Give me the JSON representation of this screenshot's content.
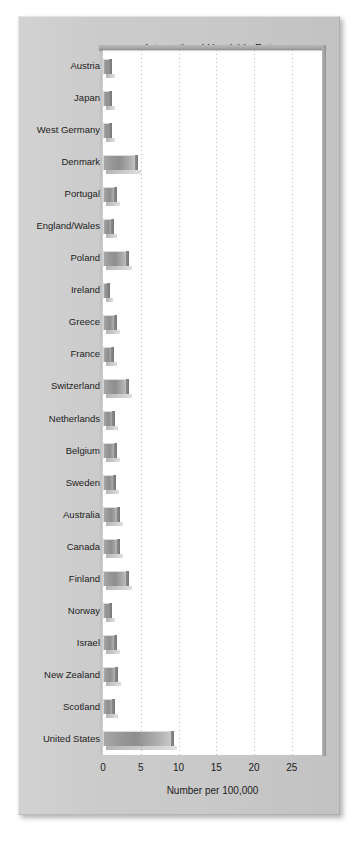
{
  "figure": {
    "title": "International Homicide Rates",
    "card_color": "#c9c9c9",
    "plot_background": "#ffffff",
    "bar_color": "#9a9a9a"
  },
  "chart_data": {
    "type": "bar",
    "orientation": "horizontal",
    "title": "International Homicide Rates",
    "xlabel": "Number per 100,000",
    "ylabel": "",
    "xlim": [
      0,
      29
    ],
    "ylim": null,
    "grid": "vertical dotted gridlines at x ticks",
    "legend": "none",
    "xticks": [
      0,
      5,
      10,
      15,
      20,
      25
    ],
    "xtick_labels": [
      "0",
      "5",
      "10",
      "15",
      "20",
      "25"
    ],
    "categories": [
      "Austria",
      "Japan",
      "West Germany",
      "Denmark",
      "Portugal",
      "England/Wales",
      "Poland",
      "Ireland",
      "Greece",
      "France",
      "Switzerland",
      "Netherlands",
      "Belgium",
      "Sweden",
      "Australia",
      "Canada",
      "Finland",
      "Norway",
      "Israel",
      "New Zealand",
      "Scotland",
      "United States"
    ],
    "values": [
      1.2,
      1.2,
      1.2,
      4.6,
      1.8,
      1.4,
      3.5,
      0.9,
      1.8,
      1.5,
      3.4,
      1.6,
      1.8,
      1.7,
      2.2,
      2.2,
      3.4,
      1.2,
      1.9,
      2.0,
      1.6,
      9.4
    ]
  }
}
